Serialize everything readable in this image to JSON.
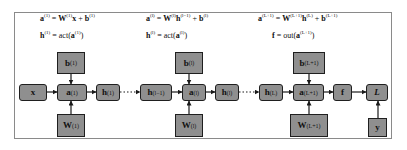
{
  "diagram": {
    "equations": {
      "layer_first": {
        "line1": {
          "lhs": "a",
          "lhs_sup": "(1)",
          "eq": " = ",
          "w": "W",
          "w_sup": "(1)",
          "x": "x",
          "plus": " + ",
          "b": "b",
          "b_sup": "(1)"
        },
        "line2": {
          "lhs": "h",
          "lhs_sup": "(1)",
          "eq": " = act(",
          "a": "a",
          "a_sup": "(1)",
          "close": ")"
        }
      },
      "layer_l": {
        "line1": {
          "lhs": "a",
          "lhs_sup": "(l)",
          "eq": " = ",
          "w": "W",
          "w_sup": "(l)",
          "h": "h",
          "h_sup": "(l−1)",
          "plus": " + ",
          "b": "b",
          "b_sup": "(l)"
        },
        "line2": {
          "lhs": "h",
          "lhs_sup": "(l)",
          "eq": " = act(",
          "a": "a",
          "a_sup": "(l)",
          "close": ")"
        }
      },
      "layer_out": {
        "line1": {
          "lhs": "a",
          "lhs_sup": "(L+1)",
          "eq": " = ",
          "w": "W",
          "w_sup": "(L+1)",
          "h": "h",
          "h_sup": "(L)",
          "plus": " + ",
          "b": "b",
          "b_sup": "(L+1)"
        },
        "line2": {
          "lhs": "f",
          "eq": " = out(",
          "a": "a",
          "a_sup": "(L+1)",
          "close": ")"
        }
      }
    },
    "nodes": {
      "x": {
        "label": "x"
      },
      "a1": {
        "label": "a",
        "sup": "(1)"
      },
      "b1": {
        "label": "b",
        "sup": "(1)"
      },
      "W1": {
        "label": "W",
        "sup": "(1)"
      },
      "h1": {
        "label": "h",
        "sup": "(1)"
      },
      "hlm1": {
        "label": "h",
        "sup": "(l−1)"
      },
      "al": {
        "label": "a",
        "sup": "(l)"
      },
      "bl": {
        "label": "b",
        "sup": "(l)"
      },
      "Wl": {
        "label": "W",
        "sup": "(l)"
      },
      "hl": {
        "label": "h",
        "sup": "(l)"
      },
      "hL": {
        "label": "h",
        "sup": "(L)"
      },
      "aL1": {
        "label": "a",
        "sup": "(L+1)"
      },
      "bL1": {
        "label": "b",
        "sup": "(L+1)"
      },
      "WL1": {
        "label": "W",
        "sup": "(L+1)"
      },
      "f": {
        "label": "f"
      },
      "loss": {
        "label": "L"
      },
      "y": {
        "label": "y"
      }
    },
    "colors": {
      "node_fill": "#8f8f8f",
      "node_border": "#1f1f1f",
      "frame": "#8a8a8a",
      "wire": "#1a1a1a"
    }
  }
}
